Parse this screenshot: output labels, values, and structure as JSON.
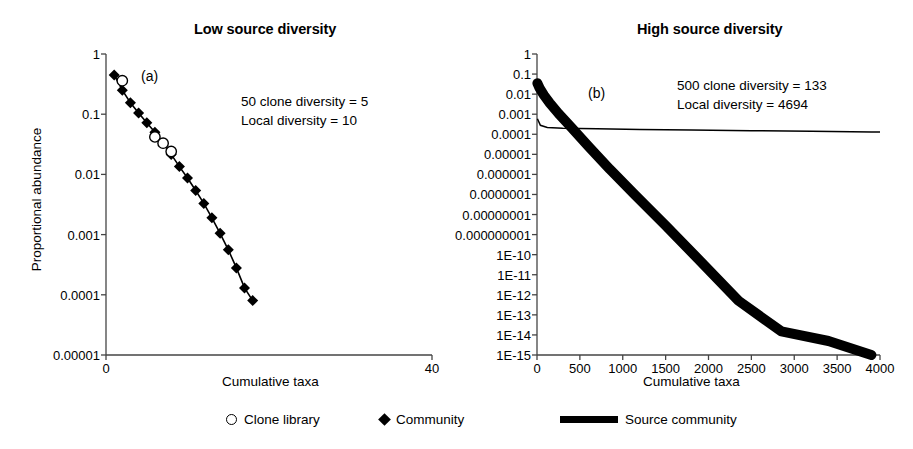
{
  "figure": {
    "legend": {
      "items": [
        {
          "name": "clone-library",
          "label": "Clone library",
          "symbol": "open-circle"
        },
        {
          "name": "community",
          "label": "Community",
          "symbol": "filled-diamond"
        },
        {
          "name": "source-community",
          "label": "Source community",
          "symbol": "thick-line"
        }
      ]
    }
  },
  "chart_data": [
    {
      "type": "line",
      "panel": "a",
      "panel_letter": "(a)",
      "title": "Low source diversity",
      "xlabel": "Cumulative taxa",
      "ylabel": "Proportional abundance",
      "yscale": "log",
      "ylim": [
        1e-05,
        1
      ],
      "xlim": [
        0,
        40
      ],
      "grid": false,
      "legend_position": "below-figure",
      "yticks": [
        1,
        0.1,
        0.01,
        0.001,
        0.0001,
        1e-05
      ],
      "ytick_labels": [
        "1",
        "0.1",
        "0.01",
        "0.001",
        "0.0001",
        "0.00001"
      ],
      "xticks": [
        0,
        40
      ],
      "xtick_labels": [
        "0",
        "40"
      ],
      "annotations": [
        "50 clone diversity = 5",
        "Local diversity = 10"
      ],
      "series": [
        {
          "name": "Community",
          "marker": "filled-diamond",
          "x": [
            1,
            2,
            3,
            4,
            5,
            6,
            7,
            8,
            9,
            10,
            11,
            12,
            13,
            14,
            15,
            16,
            17,
            18
          ],
          "values": [
            0.45,
            0.25,
            0.155,
            0.105,
            0.072,
            0.05,
            0.033,
            0.0215,
            0.0135,
            0.0087,
            0.0054,
            0.0033,
            0.0019,
            0.00105,
            0.00056,
            0.00028,
            0.00013,
            8e-05
          ]
        },
        {
          "name": "Clone library",
          "marker": "open-circle",
          "x": [
            2,
            6,
            7,
            8
          ],
          "values": [
            0.36,
            0.042,
            0.033,
            0.024
          ]
        }
      ]
    },
    {
      "type": "line",
      "panel": "b",
      "panel_letter": "(b)",
      "title": "High source diversity",
      "xlabel": "Cumulative taxa",
      "ylabel": "Proportional abundance",
      "yscale": "log",
      "ylim": [
        1e-15,
        1
      ],
      "xlim": [
        0,
        4000
      ],
      "grid": false,
      "legend_position": "below-figure",
      "yticks": [
        1,
        0.1,
        0.01,
        0.001,
        0.0001,
        1e-05,
        1e-06,
        1e-07,
        1e-08,
        1e-09,
        1e-10,
        1e-11,
        1e-12,
        1e-13,
        1e-14,
        1e-15
      ],
      "ytick_labels": [
        "1",
        "0.1",
        "0.01",
        "0.001",
        "0.0001",
        "0.00001",
        "0.000001",
        "0.0000001",
        "0.00000001",
        "0.000000001",
        "1E-10",
        "1E-11",
        "1E-12",
        "1E-13",
        "1E-14",
        "1E-15"
      ],
      "xticks": [
        0,
        500,
        1000,
        1500,
        2000,
        2500,
        3000,
        3500,
        4000
      ],
      "xtick_labels": [
        "0",
        "500",
        "1000",
        "1500",
        "2000",
        "2500",
        "3000",
        "3500",
        "4000"
      ],
      "annotations": [
        "500 clone diversity = 133",
        "Local diversity = 4694"
      ],
      "series": [
        {
          "name": "Source community",
          "marker": "thick-band",
          "x": [
            5,
            30,
            80,
            150,
            250,
            400,
            600,
            850,
            1150,
            1500,
            1900,
            2350,
            2850,
            3400,
            3900
          ],
          "values": [
            0.035,
            0.02,
            0.009,
            0.0035,
            0.0011,
            0.00022,
            2.5e-05,
            1.8e-06,
            9e-08,
            2.8e-09,
            5e-11,
            5e-13,
            1.5e-14,
            5e-15,
            1e-15
          ]
        },
        {
          "name": "Community",
          "marker": "thin-line",
          "x": [
            5,
            40,
            120,
            300,
            700,
            1200,
            1800,
            2500,
            3200,
            3900,
            4000
          ],
          "values": [
            0.0006,
            0.00028,
            0.00022,
            0.0002,
            0.00019,
            0.000175,
            0.000165,
            0.00015,
            0.00014,
            0.00013,
            0.00013
          ]
        }
      ]
    }
  ]
}
